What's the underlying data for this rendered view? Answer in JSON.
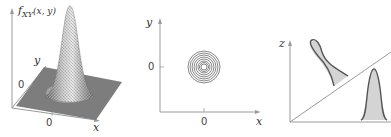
{
  "panels": [
    {
      "id": "surface-plot",
      "type": "3d-surface",
      "z_label": "f_XY(x, y)",
      "z_label_main": "f",
      "z_label_sub": "XY",
      "z_label_args": "(x, y)",
      "x_label": "x",
      "y_label": "y",
      "x_tick": "0",
      "y_tick": "0"
    },
    {
      "id": "contour-plot",
      "type": "contour",
      "x_label": "x",
      "y_label": "y",
      "x_tick": "0",
      "y_tick": "0",
      "contour_count": 8
    },
    {
      "id": "slice-plot",
      "type": "cross-section",
      "z_label": "z",
      "curves": [
        "skewed-bell-upper-left",
        "symmetric-bell-lower-right"
      ]
    }
  ],
  "colors": {
    "axis": "#9a9a9a",
    "plane": "#7d7d7d",
    "mesh_light": "#d8d8d8",
    "mesh_dark": "#6a6a6a",
    "contour": "#555555",
    "curve_stroke": "#555555",
    "curve_fill": "#d4d4d4",
    "text": "#333333"
  }
}
